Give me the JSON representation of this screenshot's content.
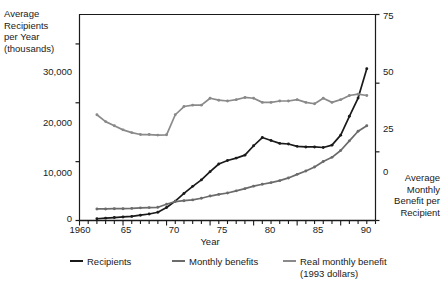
{
  "chart_data": {
    "type": "line",
    "title": "",
    "ylabel": "Average\nRecipients\nper Year\n(thousands)",
    "y2label": "Average\nMonthly\nBenefit per\nRecipient",
    "xlabel": "Year",
    "xlim": [
      1960,
      1994
    ],
    "ylim": [
      0,
      35000
    ],
    "y2lim": [
      0,
      75
    ],
    "yticks": [
      "0",
      "10,000",
      "20,000",
      "30,000"
    ],
    "ytick_values": [
      0,
      10000,
      20000,
      30000
    ],
    "y2ticks": [
      "0",
      "25",
      "50",
      "75"
    ],
    "y2tick_values": [
      0,
      25,
      50,
      75
    ],
    "xticks": [
      "1960",
      "65",
      "70",
      "75",
      "80",
      "85",
      "90"
    ],
    "xtick_values": [
      1960,
      1965,
      1970,
      1975,
      1980,
      1985,
      1990
    ],
    "grid": false,
    "legend_position": "bottom",
    "x": [
      1962,
      1963,
      1964,
      1965,
      1966,
      1967,
      1968,
      1969,
      1970,
      1971,
      1972,
      1973,
      1974,
      1975,
      1976,
      1977,
      1978,
      1979,
      1980,
      1981,
      1982,
      1983,
      1984,
      1985,
      1986,
      1987,
      1988,
      1989,
      1990,
      1991,
      1992,
      1993
    ],
    "series": [
      {
        "name": "Recipients",
        "color": "#1a1a1a",
        "axis": "left",
        "units": "thousands",
        "values": [
          300,
          400,
          500,
          600,
          700,
          900,
          1100,
          1400,
          2200,
          3300,
          4600,
          5800,
          6900,
          8300,
          9600,
          10200,
          10600,
          11100,
          12700,
          14100,
          13600,
          13100,
          13000,
          12600,
          12500,
          12500,
          12400,
          12800,
          14500,
          17700,
          20800,
          25800
        ]
      },
      {
        "name": "Monthly benefits",
        "color": "#6b6b6b",
        "axis": "right",
        "units": "dollars",
        "values": [
          4.2,
          4.2,
          4.3,
          4.3,
          4.4,
          4.6,
          4.7,
          4.8,
          5.9,
          6.9,
          7.2,
          7.5,
          8.1,
          8.9,
          9.5,
          10.0,
          10.8,
          11.6,
          12.5,
          13.2,
          13.8,
          14.5,
          15.5,
          16.8,
          18.0,
          19.5,
          21.5,
          23.0,
          25.5,
          29.0,
          32.5,
          34.5
        ]
      },
      {
        "name": "Real monthly benefit\n(1993 dollars)",
        "color": "#8a8a8a",
        "axis": "right",
        "units": "1993 dollars",
        "values": [
          38.5,
          36.0,
          34.5,
          33.0,
          32.0,
          31.3,
          31.3,
          31.1,
          31.2,
          38.5,
          41.5,
          42.0,
          42.0,
          44.5,
          43.8,
          43.5,
          44.0,
          44.8,
          44.5,
          43.0,
          43.0,
          43.5,
          43.5,
          44.0,
          43.0,
          42.5,
          44.5,
          43.0,
          44.0,
          45.5,
          46.0,
          45.5
        ]
      }
    ]
  },
  "legend": {
    "items": [
      {
        "label": "Recipients",
        "sub": ""
      },
      {
        "label": "Monthly benefits",
        "sub": ""
      },
      {
        "label": "Real monthly benefit",
        "sub": "(1993 dollars)"
      }
    ]
  }
}
